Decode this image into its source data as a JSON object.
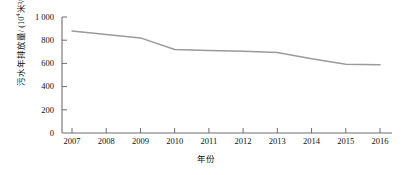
{
  "chart_data": {
    "type": "line",
    "title": "",
    "xlabel": "年份",
    "ylabel": "污水年排放量/ (10⁴米³/年)",
    "ylabel_main": "污水年排放量/ (10",
    "ylabel_sup": "4",
    "ylabel_tail": "米³/年)",
    "categories": [
      "2007",
      "2008",
      "2009",
      "2010",
      "2011",
      "2012",
      "2013",
      "2014",
      "2015",
      "2016"
    ],
    "x": [
      2007,
      2008,
      2009,
      2010,
      2011,
      2012,
      2013,
      2014,
      2015,
      2016
    ],
    "values": [
      880,
      850,
      820,
      720,
      712,
      705,
      695,
      640,
      592,
      588
    ],
    "series": [
      {
        "name": "污水年排放量",
        "values": [
          880,
          850,
          820,
          720,
          712,
          705,
          695,
          640,
          592,
          588
        ]
      }
    ],
    "ylim": [
      0,
      1000
    ],
    "yticks": [
      0,
      200,
      400,
      600,
      800,
      1000
    ],
    "ytick_labels": [
      "0",
      "200",
      "400",
      "600",
      "800",
      "1 000"
    ],
    "xtick_labels": [
      "2007",
      "2008",
      "2009",
      "2010",
      "2011",
      "2012",
      "2013",
      "2014",
      "2015",
      "2016"
    ],
    "grid": false,
    "legend": false,
    "legend_position": "none",
    "line_color": "#9a9a9a",
    "axis_color": "#6e6e6e",
    "background": "#ffffff"
  }
}
